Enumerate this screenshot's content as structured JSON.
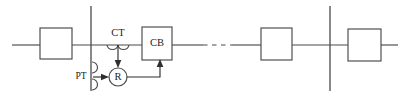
{
  "diagram": {
    "type": "single-line-schematic",
    "colors": {
      "line": "#4a4a4a",
      "text": "#1c1c1c",
      "background": "#ffffff"
    },
    "labels": {
      "ct": "CT",
      "cb": "CB",
      "pt": "PT",
      "relay": "R"
    },
    "components": [
      {
        "id": "load-box-left",
        "kind": "box",
        "label": ""
      },
      {
        "id": "bus-left",
        "kind": "vertical-bus",
        "label": ""
      },
      {
        "id": "ct",
        "kind": "current-transformer",
        "label": "CT"
      },
      {
        "id": "cb",
        "kind": "circuit-breaker",
        "label": "CB"
      },
      {
        "id": "pt",
        "kind": "potential-transformer",
        "label": "PT"
      },
      {
        "id": "relay",
        "kind": "relay",
        "label": "R"
      },
      {
        "id": "feeder-break",
        "kind": "dashed-line",
        "label": ""
      },
      {
        "id": "load-box-mid",
        "kind": "box",
        "label": ""
      },
      {
        "id": "bus-right",
        "kind": "vertical-bus",
        "label": ""
      },
      {
        "id": "load-box-right",
        "kind": "box",
        "label": ""
      }
    ]
  }
}
